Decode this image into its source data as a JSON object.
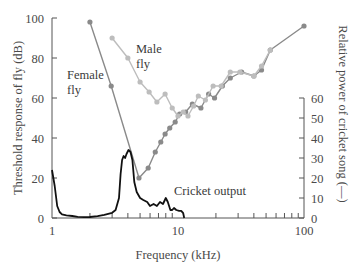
{
  "chart_data": {
    "type": "line",
    "title": "",
    "xlabel": "Frequency (kHz)",
    "ylabel": "Threshold response of fly (dB)",
    "y2label": "Relative power of cricket song (—)",
    "xscale": "log",
    "xlim": [
      1,
      100
    ],
    "ylim": [
      0,
      100
    ],
    "y2lim": [
      0,
      60
    ],
    "grid": false,
    "x_tick_labels": [
      "1",
      "10",
      "100"
    ],
    "y_tick_labels": [
      "0",
      "20",
      "40",
      "60",
      "80",
      "100"
    ],
    "y2_tick_labels": [
      "0",
      "10",
      "20",
      "30",
      "40",
      "50",
      "60"
    ],
    "annotations": [
      "Female fly",
      "Male fly",
      "Cricket output"
    ],
    "series": [
      {
        "name": "Female fly",
        "axis": "left",
        "color": "#8a8a8a",
        "marker": "circle",
        "x": [
          2.0,
          2.95,
          4.9,
          5.8,
          6.6,
          7.3,
          7.9,
          8.6,
          9.5,
          10.3,
          11.5,
          13.0,
          15.2,
          17.5,
          19.5,
          22.5,
          26.0,
          32.0,
          40.0,
          46.0,
          54.0,
          100.0
        ],
        "y": [
          98,
          66,
          20,
          25,
          33,
          38,
          42,
          45,
          48,
          52,
          53,
          57,
          55,
          62,
          60,
          66,
          70,
          73,
          71,
          74,
          84,
          96
        ]
      },
      {
        "name": "Male fly",
        "axis": "left",
        "color": "#bdbdbd",
        "marker": "circle",
        "x": [
          3.0,
          4.0,
          5.0,
          5.9,
          6.8,
          7.9,
          9.0,
          10.0,
          11.0,
          12.0,
          13.3,
          14.5,
          16.5,
          19.0,
          22.0,
          26.0,
          31.0,
          40.0,
          46.0,
          54.0
        ],
        "y": [
          90,
          80,
          68,
          63,
          58,
          62,
          55,
          51,
          53,
          51,
          56,
          61,
          59,
          66,
          66,
          73,
          73,
          71,
          76,
          84
        ]
      },
      {
        "name": "Cricket output",
        "axis": "right",
        "color": "#111111",
        "x": [
          1.0,
          1.05,
          1.1,
          1.15,
          1.2,
          1.3,
          1.45,
          1.6,
          1.8,
          2.0,
          2.3,
          2.6,
          3.0,
          3.2,
          3.4,
          3.5,
          3.6,
          3.7,
          3.8,
          3.9,
          4.05,
          4.2,
          4.35,
          4.5,
          4.7,
          5.0,
          5.3,
          5.7,
          6.0,
          6.4,
          6.8,
          7.2,
          7.6,
          8.0,
          8.3,
          8.7,
          9.0,
          9.3,
          9.7,
          10.2,
          10.6,
          11.0,
          11.2
        ],
        "y": [
          24,
          16,
          6,
          3,
          1.8,
          1.3,
          1.0,
          0.6,
          0.4,
          0.5,
          0.9,
          1.6,
          2.6,
          4,
          10,
          22,
          29,
          31,
          30,
          32,
          34,
          33,
          29,
          18,
          13,
          10,
          9,
          8,
          6,
          7,
          6,
          8,
          7,
          10,
          8,
          4,
          4,
          5,
          4,
          3.6,
          3.6,
          2.4,
          0
        ]
      }
    ]
  }
}
